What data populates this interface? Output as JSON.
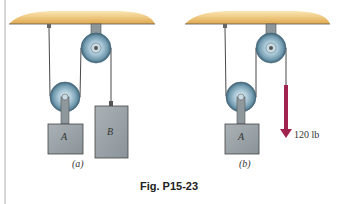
{
  "figure": {
    "caption": "Fig. P15-23",
    "colors": {
      "ceiling": "#e8b862",
      "pulley": "#8fb4c8",
      "block": "#9aa3a8",
      "rope": "#333333",
      "force_arrow": "#a0234e"
    }
  },
  "panel_a": {
    "label": "(a)",
    "block_a_label": "A",
    "block_b_label": "B"
  },
  "panel_b": {
    "label": "(b)",
    "block_a_label": "A",
    "force_label": "120 lb"
  }
}
